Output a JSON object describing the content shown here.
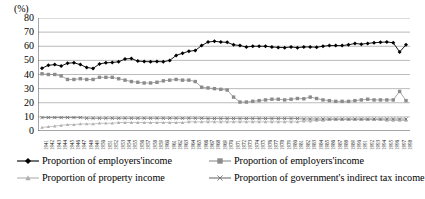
{
  "chart_data": {
    "type": "line",
    "title": "",
    "subtitle": "",
    "xlabel": "",
    "ylabel": "(%)",
    "yunit": "(%)",
    "ylim": [
      0,
      80
    ],
    "ytick_labels": [
      "0",
      "10",
      "20",
      "30",
      "40",
      "50",
      "60",
      "70",
      "80"
    ],
    "ytick_values": [
      0,
      10,
      20,
      30,
      40,
      50,
      60,
      70,
      80
    ],
    "grid": true,
    "grid_axis": "y",
    "legend_position": "bottom",
    "legend_columns": 2,
    "x": [
      "1941",
      "1942",
      "1943",
      "1944",
      "1945",
      "1946",
      "1947",
      "1948",
      "1949",
      "1950",
      "1951",
      "1952",
      "1953",
      "1954",
      "1955",
      "1956",
      "1957",
      "1958",
      "1959",
      "1960",
      "1961",
      "1962",
      "1963",
      "1964",
      "1965",
      "1966",
      "1967",
      "1968",
      "1969",
      "1970",
      "1971",
      "1972",
      "1973",
      "1974",
      "1975",
      "1976",
      "1977",
      "1978",
      "1979",
      "1980",
      "1981",
      "1982",
      "1983",
      "1984",
      "1985",
      "1986",
      "1987",
      "1988",
      "1989",
      "1990",
      "1991",
      "1992",
      "1993",
      "1994",
      "1995",
      "1996",
      "1997",
      "1998"
    ],
    "series": [
      {
        "name": "Proportion of employers'income",
        "marker": "diamond",
        "color": "#000000",
        "values": [
          44.5,
          46.5,
          47.0,
          46.0,
          48.0,
          48.3,
          47.0,
          45.0,
          44.3,
          47.5,
          48.3,
          48.5,
          49.0,
          51.0,
          51.3,
          49.5,
          49.2,
          49.0,
          49.2,
          49.0,
          50.0,
          53.5,
          55.0,
          56.5,
          57.0,
          60.5,
          63.0,
          63.5,
          63.0,
          62.8,
          61.0,
          60.5,
          59.5,
          60.0,
          60.0,
          60.0,
          59.5,
          59.2,
          59.0,
          59.5,
          59.0,
          59.5,
          59.5,
          59.3,
          60.0,
          60.5,
          60.5,
          60.5,
          61.0,
          62.0,
          61.5,
          62.0,
          62.5,
          62.8,
          63.0,
          62.5,
          56.0,
          61.0
        ]
      },
      {
        "name": "Proportion of employers'income",
        "marker": "square",
        "color": "#8c8c8c",
        "values": [
          40.5,
          40.0,
          40.0,
          39.0,
          36.5,
          36.5,
          37.0,
          36.5,
          36.5,
          38.0,
          38.0,
          38.0,
          37.0,
          36.0,
          35.0,
          34.5,
          34.0,
          34.0,
          34.5,
          35.5,
          36.0,
          36.5,
          36.0,
          36.0,
          35.0,
          31.0,
          30.5,
          30.0,
          29.5,
          29.0,
          24.0,
          20.5,
          20.5,
          21.0,
          21.5,
          22.0,
          22.5,
          22.5,
          22.0,
          22.5,
          23.0,
          22.8,
          24.0,
          23.0,
          22.0,
          21.5,
          21.0,
          21.0,
          21.0,
          21.5,
          22.0,
          22.5,
          22.0,
          22.0,
          22.0,
          22.0,
          28.0,
          21.5
        ]
      },
      {
        "name": "Proportion of property income",
        "marker": "triangle",
        "color": "#b0b0b0",
        "values": [
          2.5,
          3.0,
          3.5,
          4.0,
          4.5,
          4.5,
          5.0,
          5.0,
          5.0,
          5.5,
          5.5,
          5.5,
          6.0,
          6.0,
          6.0,
          6.0,
          6.0,
          6.0,
          6.0,
          6.0,
          6.0,
          6.0,
          6.0,
          6.5,
          6.5,
          6.5,
          6.5,
          6.5,
          6.5,
          6.5,
          6.5,
          6.5,
          6.5,
          6.5,
          6.5,
          6.5,
          6.5,
          6.5,
          6.5,
          6.5,
          6.5,
          7.0,
          7.0,
          7.5,
          7.5,
          8.0,
          8.0,
          8.0,
          8.0,
          8.0,
          8.0,
          8.0,
          8.0,
          8.0,
          7.5,
          7.5,
          7.5,
          7.5
        ]
      },
      {
        "name": "Proportion of government's indirect tax income",
        "marker": "cross",
        "color": "#6e6e6e",
        "values": [
          9.5,
          9.5,
          9.5,
          9.5,
          9.5,
          9.5,
          9.5,
          9.0,
          9.0,
          9.0,
          9.0,
          9.0,
          9.0,
          9.0,
          9.0,
          9.0,
          9.0,
          9.0,
          9.0,
          9.0,
          9.0,
          9.0,
          9.0,
          9.0,
          9.0,
          9.0,
          8.8,
          8.8,
          8.8,
          8.8,
          8.8,
          8.8,
          8.8,
          8.8,
          8.8,
          8.8,
          8.8,
          8.8,
          8.8,
          8.8,
          8.8,
          8.5,
          8.5,
          8.5,
          8.5,
          8.5,
          8.5,
          8.5,
          8.5,
          8.5,
          8.5,
          8.5,
          8.5,
          8.5,
          8.5,
          8.5,
          8.5,
          8.5
        ]
      }
    ]
  },
  "axis": {
    "unit_label": "(%)"
  },
  "legend": {
    "items": [
      {
        "label": "Proportion of employers'income",
        "marker": "diamond",
        "color": "#000000"
      },
      {
        "label": "Proportion of employers'income",
        "marker": "square",
        "color": "#8c8c8c"
      },
      {
        "label": "Proportion of property income",
        "marker": "triangle",
        "color": "#b0b0b0"
      },
      {
        "label": "Proportion of government's indirect tax income",
        "marker": "cross",
        "color": "#6e6e6e"
      }
    ]
  },
  "colors": {
    "series_1": "#000000",
    "series_2": "#8c8c8c",
    "series_3": "#b0b0b0",
    "series_4": "#6e6e6e",
    "grid": "#a9a9a9",
    "axis": "#4d4d4d",
    "background": "#ffffff"
  }
}
